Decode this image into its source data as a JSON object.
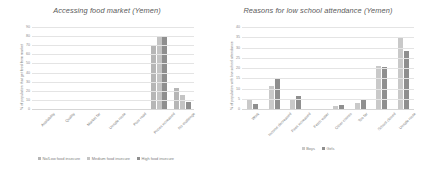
{
  "chart_data": [
    {
      "id": "accessing-food-market",
      "type": "bar",
      "title": "Accessing food market (Yemen)",
      "xlabel": "",
      "ylabel": "% of population that get food from market",
      "ylim": [
        0,
        90
      ],
      "yticks": [
        0,
        10,
        20,
        30,
        40,
        50,
        60,
        70,
        80,
        90
      ],
      "grid": true,
      "legend_position": "bottom",
      "categories": [
        "Availability",
        "Quality",
        "Market far",
        "Unsafe route",
        "Poor road",
        "Prices increased",
        "No challenge"
      ],
      "series": [
        {
          "name": "No/Low food insecure",
          "color": "#b6b6b6",
          "values": [
            0.8,
            0.6,
            0.8,
            0.7,
            0.6,
            71,
            24
          ]
        },
        {
          "name": "Medium food insecure",
          "color": "#c4c4c4",
          "values": [
            0.7,
            0.8,
            1.0,
            1.6,
            0.9,
            80,
            16
          ]
        },
        {
          "name": "High food insecure",
          "color": "#8f8f8f",
          "values": [
            0.9,
            0.9,
            1.6,
            1.3,
            1.5,
            80,
            9
          ]
        }
      ]
    },
    {
      "id": "reasons-low-school-attendance",
      "type": "bar",
      "title": "Reasons for low school attendance (Yemen)",
      "xlabel": "",
      "ylabel": "% of population with low school attendance",
      "ylim": [
        0,
        40
      ],
      "yticks": [
        0,
        5,
        10,
        15,
        20,
        25,
        30,
        35,
        40
      ],
      "grid": true,
      "legend_position": "bottom",
      "categories": [
        "Work",
        "Income decreased",
        "Fees increased",
        "Fetch water",
        "Other chores",
        "Too far",
        "School closed",
        "Unsafe route"
      ],
      "series": [
        {
          "name": "Boys",
          "color": "#c9c9c9",
          "values": [
            5.0,
            11.6,
            5.3,
            0.4,
            1.8,
            3.6,
            21.6,
            35.7
          ]
        },
        {
          "name": "Girls",
          "color": "#8f8f8f",
          "values": [
            3.1,
            15.1,
            6.6,
            0.3,
            2.6,
            5.6,
            20.9,
            29.0
          ]
        }
      ]
    }
  ]
}
